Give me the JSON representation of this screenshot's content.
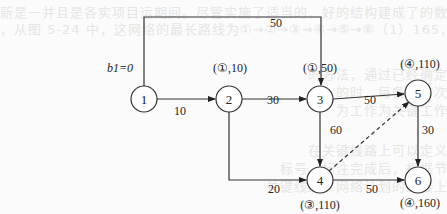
{
  "diagram": {
    "type": "network-shortest-path",
    "start_label": "b1=0",
    "nodes": [
      {
        "id": "1",
        "x": 144,
        "y": 99,
        "label": ""
      },
      {
        "id": "2",
        "x": 229,
        "y": 99,
        "label": "(①,10)"
      },
      {
        "id": "3",
        "x": 320,
        "y": 99,
        "label": "(①,50)"
      },
      {
        "id": "4",
        "x": 320,
        "y": 180,
        "label": "(③,110)"
      },
      {
        "id": "5",
        "x": 418,
        "y": 93,
        "label": "(④,110)"
      },
      {
        "id": "6",
        "x": 418,
        "y": 180,
        "label": "(④,160)"
      }
    ],
    "edges": [
      {
        "from": "1",
        "to": "3",
        "weight": "50",
        "style": "solid"
      },
      {
        "from": "1",
        "to": "2",
        "weight": "10",
        "style": "solid"
      },
      {
        "from": "2",
        "to": "3",
        "weight": "30",
        "style": "solid"
      },
      {
        "from": "2",
        "to": "4",
        "weight": "20",
        "style": "solid"
      },
      {
        "from": "3",
        "to": "5",
        "weight": "50",
        "style": "solid"
      },
      {
        "from": "3",
        "to": "4",
        "weight": "60",
        "style": "solid"
      },
      {
        "from": "4",
        "to": "5",
        "weight": "",
        "style": "dashed"
      },
      {
        "from": "5",
        "to": "6",
        "weight": "30",
        "style": "solid"
      },
      {
        "from": "4",
        "to": "6",
        "weight": "50",
        "style": "solid"
      }
    ]
  }
}
